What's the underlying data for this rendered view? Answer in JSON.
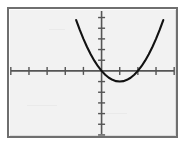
{
  "figure": {
    "kind": "graphing-calculator-plot",
    "background_color": "#f2f2f2",
    "frame_color": "#6f6f6f",
    "axis_color": "#555555",
    "curve_color": "#121212",
    "title": "",
    "caption": ""
  },
  "chart_data": {
    "type": "line",
    "title": "",
    "subtitle": "",
    "xlabel": "",
    "ylabel": "",
    "grid": false,
    "legend": [],
    "legend_position": "none",
    "axis_style": "cartesian-crosshair",
    "xlim": [
      -5.1,
      4.1
    ],
    "ylim": [
      -6.1,
      5.8
    ],
    "xticks": [
      -5,
      -4,
      -3,
      -2,
      -1,
      1,
      2,
      3,
      4
    ],
    "yticks": [
      -6,
      -5,
      -4,
      -3,
      -2,
      -1,
      1,
      2,
      3,
      4,
      5
    ],
    "xtick_labels": [],
    "ytick_labels": [],
    "tick_label_visible": false,
    "origin": [
      0,
      0
    ],
    "series": [
      {
        "name": "parabola",
        "kind": "quadratic",
        "equation": "y = (x - 1)^2 - 1",
        "vertex": [
          1,
          -1
        ],
        "opens": "up",
        "leading_coefficient": 1,
        "roots": [
          0,
          2
        ],
        "y_intercept": 0,
        "x": [
          -1.4,
          -1.2,
          -1.0,
          -0.8,
          -0.6,
          -0.4,
          -0.2,
          0.0,
          0.2,
          0.4,
          0.6,
          0.8,
          1.0,
          1.2,
          1.4,
          1.6,
          1.8,
          2.0,
          2.2,
          2.4,
          2.6,
          2.8,
          3.0,
          3.2,
          3.4
        ],
        "values": [
          4.76,
          3.84,
          3.0,
          2.24,
          1.56,
          0.96,
          0.44,
          0.0,
          -0.36,
          -0.64,
          -0.84,
          -0.96,
          -1.0,
          -0.96,
          -0.84,
          -0.64,
          -0.36,
          0.0,
          0.44,
          0.96,
          1.56,
          2.24,
          3.0,
          3.84,
          4.76
        ]
      }
    ]
  }
}
